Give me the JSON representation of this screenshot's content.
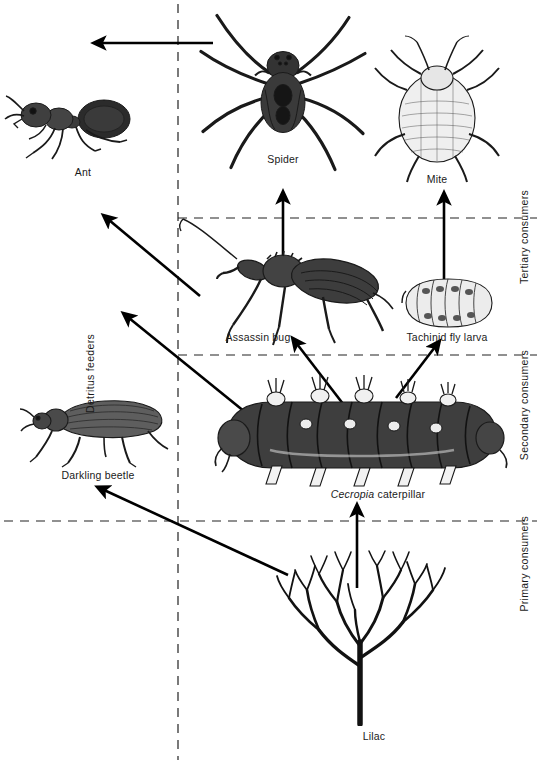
{
  "figure": {
    "background_color": "#ffffff",
    "ink_color": "#000000"
  },
  "trophic_zones": [
    {
      "id": "tertiary",
      "label": "Tertiary consumers",
      "side": "right"
    },
    {
      "id": "secondary",
      "label": "Secondary consumers",
      "side": "right"
    },
    {
      "id": "primary",
      "label": "Primary consumers",
      "side": "right"
    },
    {
      "id": "detritus",
      "label": "Detritus feeders",
      "side": "left"
    }
  ],
  "organisms": [
    {
      "id": "ant",
      "label": "Ant",
      "label_italic_prefix": "",
      "x": 75,
      "y": 125,
      "caption_x": 83,
      "caption_y": 172
    },
    {
      "id": "spider",
      "label": "Spider",
      "label_italic_prefix": "",
      "x": 283,
      "y": 95,
      "caption_x": 283,
      "caption_y": 158
    },
    {
      "id": "mite",
      "label": "Mite",
      "label_italic_prefix": "",
      "x": 437,
      "y": 110,
      "caption_x": 437,
      "caption_y": 178
    },
    {
      "id": "assassin-bug",
      "label": "Assassin bug",
      "label_italic_prefix": "",
      "x": 285,
      "y": 285,
      "caption_x": 258,
      "caption_y": 336
    },
    {
      "id": "tachinid-fly-larva",
      "label": "Tachinid fly larva",
      "label_italic_prefix": "",
      "x": 447,
      "y": 303,
      "caption_x": 447,
      "caption_y": 336
    },
    {
      "id": "darkling-beetle",
      "label": "Darkling beetle",
      "label_italic_prefix": "",
      "x": 98,
      "y": 424,
      "caption_x": 98,
      "caption_y": 474
    },
    {
      "id": "cecropia-caterpillar",
      "label": " caterpillar",
      "label_italic_prefix": "Cecropia",
      "x": 360,
      "y": 437,
      "caption_x": 378,
      "caption_y": 493
    },
    {
      "id": "lilac",
      "label": "Lilac",
      "label_italic_prefix": "",
      "x": 360,
      "y": 636,
      "caption_x": 374,
      "caption_y": 735
    }
  ],
  "energy_flow_arrows": [
    {
      "id": "spider-to-ant",
      "from": "spider",
      "to": "ant"
    },
    {
      "id": "assassin-bug-to-spider",
      "from": "assassin-bug",
      "to": "spider"
    },
    {
      "id": "tachinid-fly-larva-to-mite",
      "from": "tachinid-fly-larva",
      "to": "mite"
    },
    {
      "id": "assassin-bug-to-ant",
      "from": "assassin-bug",
      "to": "ant"
    },
    {
      "id": "caterpillar-to-assassin-bug",
      "from": "cecropia-caterpillar",
      "to": "assassin-bug"
    },
    {
      "id": "caterpillar-to-tachinid",
      "from": "cecropia-caterpillar",
      "to": "tachinid-fly-larva"
    },
    {
      "id": "caterpillar-to-ant",
      "from": "cecropia-caterpillar",
      "to": "ant"
    },
    {
      "id": "lilac-to-caterpillar",
      "from": "lilac",
      "to": "cecropia-caterpillar"
    },
    {
      "id": "lilac-to-darkling-beetle",
      "from": "lilac",
      "to": "darkling-beetle"
    },
    {
      "id": "caterpillar-to-darkling-beetle",
      "from": "cecropia-caterpillar",
      "to": "darkling-beetle"
    }
  ],
  "divider_lines": [
    {
      "id": "vertical-detritus-divider",
      "orientation": "vertical",
      "dashed": true
    },
    {
      "id": "tertiary-secondary-divider",
      "orientation": "horizontal",
      "dashed": true
    },
    {
      "id": "secondary-primary-divider",
      "orientation": "horizontal",
      "dashed": true
    },
    {
      "id": "primary-producer-divider",
      "orientation": "horizontal",
      "dashed": true
    }
  ]
}
